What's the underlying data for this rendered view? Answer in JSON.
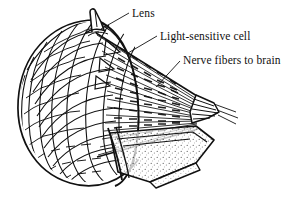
{
  "figure": {
    "kind": "scientific-line-drawing",
    "background_color": "#ffffff",
    "ink_color": "#101010"
  },
  "labels": {
    "lens": "Lens",
    "light_sensitive_cell": "Light-sensitive cell",
    "nerve_fibers": "Nerve fibers to brain"
  },
  "callouts": [
    {
      "id": "lens",
      "text": "Lens",
      "text_x": 132,
      "text_y": 7,
      "leader_from": [
        128,
        14
      ],
      "leader_to": [
        101,
        29
      ]
    },
    {
      "id": "light-sensitive-cell",
      "text": "Light-sensitive cell",
      "text_x": 160,
      "text_y": 30,
      "leader_from": [
        156,
        37
      ],
      "leader_to": [
        128,
        53
      ]
    },
    {
      "id": "nerve-fibers-to-brain",
      "text": "Nerve fibers to brain",
      "text_x": 183,
      "text_y": 54,
      "leader_from": [
        180,
        62
      ],
      "leader_to": [
        158,
        86
      ]
    }
  ],
  "parts": {
    "lens_spike": "lens-projection",
    "facet_shell": "honeycomb-ommatidia-surface",
    "rod_bundle": "converging-light-sensitive-cells",
    "nerve_bundle": "nerve-fiber-bundle",
    "cut_surface": "stippled-cut-face"
  }
}
